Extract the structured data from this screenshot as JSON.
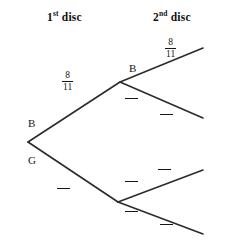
{
  "diagram": {
    "type": "probability-tree",
    "headers": [
      {
        "id": "first-disc",
        "ordinal": "1",
        "sup": "st",
        "text": " disc"
      },
      {
        "id": "second-disc",
        "ordinal": "2",
        "sup": "nd",
        "text": " disc"
      }
    ],
    "nodes": [
      {
        "id": "root",
        "label": ""
      },
      {
        "id": "stage1-b",
        "label": "B"
      },
      {
        "id": "stage1-g",
        "label": "G"
      },
      {
        "id": "stage2-bb",
        "label": "B"
      }
    ],
    "branch_labels": [
      {
        "id": "root-to-b",
        "numerator": "8",
        "denominator": "11",
        "blank": false
      },
      {
        "id": "root-to-g",
        "numerator": "",
        "denominator": "",
        "blank": true
      },
      {
        "id": "b-to-bb",
        "numerator": "8",
        "denominator": "11",
        "blank": false
      },
      {
        "id": "b-to-bg",
        "numerator": "",
        "denominator": "",
        "blank": true
      },
      {
        "id": "g-to-gb",
        "numerator": "",
        "denominator": "",
        "blank": true
      },
      {
        "id": "g-to-gg",
        "numerator": "",
        "denominator": "",
        "blank": true
      }
    ],
    "colors": {
      "line": "#2b2b2b",
      "text": "#161616",
      "background": "#ffffff"
    }
  }
}
